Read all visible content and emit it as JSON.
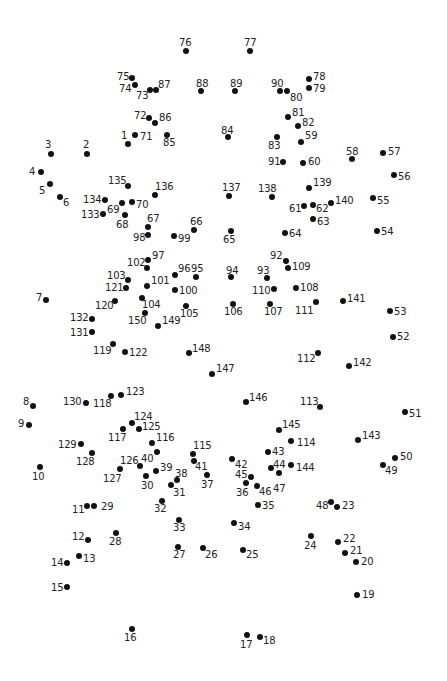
{
  "puzzle": {
    "title": "",
    "dot_color": "#111111",
    "label_color": "#222222",
    "points": [
      {
        "n": "1",
        "x": 128,
        "y": 144,
        "lx": 121,
        "ly": 131
      },
      {
        "n": "2",
        "x": 87,
        "y": 154,
        "lx": 83,
        "ly": 140
      },
      {
        "n": "3",
        "x": 51,
        "y": 154,
        "lx": 45,
        "ly": 140
      },
      {
        "n": "4",
        "x": 41,
        "y": 172,
        "lx": 29,
        "ly": 167
      },
      {
        "n": "5",
        "x": 50,
        "y": 184,
        "lx": 39,
        "ly": 186
      },
      {
        "n": "6",
        "x": 60,
        "y": 197,
        "lx": 63,
        "ly": 198
      },
      {
        "n": "7",
        "x": 46,
        "y": 300,
        "lx": 36,
        "ly": 293
      },
      {
        "n": "8",
        "x": 33,
        "y": 406,
        "lx": 23,
        "ly": 397
      },
      {
        "n": "9",
        "x": 29,
        "y": 425,
        "lx": 18,
        "ly": 419
      },
      {
        "n": "10",
        "x": 40,
        "y": 467,
        "lx": 32,
        "ly": 472
      },
      {
        "n": "11",
        "x": 87,
        "y": 506,
        "lx": 72,
        "ly": 505
      },
      {
        "n": "12",
        "x": 88,
        "y": 540,
        "lx": 72,
        "ly": 532
      },
      {
        "n": "13",
        "x": 79,
        "y": 556,
        "lx": 83,
        "ly": 554
      },
      {
        "n": "14",
        "x": 67,
        "y": 563,
        "lx": 51,
        "ly": 558
      },
      {
        "n": "15",
        "x": 67,
        "y": 587,
        "lx": 51,
        "ly": 583
      },
      {
        "n": "16",
        "x": 132,
        "y": 629,
        "lx": 124,
        "ly": 633
      },
      {
        "n": "17",
        "x": 247,
        "y": 635,
        "lx": 240,
        "ly": 640
      },
      {
        "n": "18",
        "x": 260,
        "y": 637,
        "lx": 263,
        "ly": 636
      },
      {
        "n": "19",
        "x": 357,
        "y": 595,
        "lx": 362,
        "ly": 590
      },
      {
        "n": "20",
        "x": 356,
        "y": 562,
        "lx": 361,
        "ly": 557
      },
      {
        "n": "21",
        "x": 345,
        "y": 553,
        "lx": 350,
        "ly": 546
      },
      {
        "n": "22",
        "x": 338,
        "y": 542,
        "lx": 343,
        "ly": 534
      },
      {
        "n": "23",
        "x": 337,
        "y": 507,
        "lx": 342,
        "ly": 501
      },
      {
        "n": "24",
        "x": 311,
        "y": 536,
        "lx": 304,
        "ly": 541
      },
      {
        "n": "25",
        "x": 243,
        "y": 550,
        "lx": 246,
        "ly": 550
      },
      {
        "n": "26",
        "x": 203,
        "y": 548,
        "lx": 205,
        "ly": 550
      },
      {
        "n": "27",
        "x": 178,
        "y": 547,
        "lx": 173,
        "ly": 550
      },
      {
        "n": "28",
        "x": 116,
        "y": 533,
        "lx": 109,
        "ly": 537
      },
      {
        "n": "29",
        "x": 94,
        "y": 506,
        "lx": 101,
        "ly": 502
      },
      {
        "n": "30",
        "x": 146,
        "y": 476,
        "lx": 141,
        "ly": 481
      },
      {
        "n": "31",
        "x": 171,
        "y": 485,
        "lx": 173,
        "ly": 488
      },
      {
        "n": "32",
        "x": 162,
        "y": 501,
        "lx": 154,
        "ly": 504
      },
      {
        "n": "33",
        "x": 179,
        "y": 520,
        "lx": 173,
        "ly": 523
      },
      {
        "n": "34",
        "x": 234,
        "y": 523,
        "lx": 238,
        "ly": 522
      },
      {
        "n": "35",
        "x": 258,
        "y": 505,
        "lx": 262,
        "ly": 501
      },
      {
        "n": "36",
        "x": 246,
        "y": 483,
        "lx": 236,
        "ly": 488
      },
      {
        "n": "37",
        "x": 207,
        "y": 475,
        "lx": 201,
        "ly": 480
      },
      {
        "n": "38",
        "x": 177,
        "y": 480,
        "lx": 175,
        "ly": 469
      },
      {
        "n": "39",
        "x": 156,
        "y": 471,
        "lx": 160,
        "ly": 463
      },
      {
        "n": "40",
        "x": 157,
        "y": 452,
        "lx": 141,
        "ly": 454
      },
      {
        "n": "41",
        "x": 194,
        "y": 461,
        "lx": 195,
        "ly": 462
      },
      {
        "n": "42",
        "x": 232,
        "y": 459,
        "lx": 235,
        "ly": 460
      },
      {
        "n": "43",
        "x": 268,
        "y": 452,
        "lx": 272,
        "ly": 447
      },
      {
        "n": "44",
        "x": 271,
        "y": 468,
        "lx": 273,
        "ly": 460
      },
      {
        "n": "45",
        "x": 251,
        "y": 477,
        "lx": 235,
        "ly": 470
      },
      {
        "n": "46",
        "x": 257,
        "y": 486,
        "lx": 259,
        "ly": 487
      },
      {
        "n": "47",
        "x": 279,
        "y": 473,
        "lx": 273,
        "ly": 484
      },
      {
        "n": "48",
        "x": 331,
        "y": 502,
        "lx": 316,
        "ly": 501
      },
      {
        "n": "49",
        "x": 383,
        "y": 465,
        "lx": 385,
        "ly": 466
      },
      {
        "n": "50",
        "x": 395,
        "y": 458,
        "lx": 400,
        "ly": 452
      },
      {
        "n": "51",
        "x": 405,
        "y": 412,
        "lx": 409,
        "ly": 409
      },
      {
        "n": "52",
        "x": 393,
        "y": 337,
        "lx": 397,
        "ly": 332
      },
      {
        "n": "53",
        "x": 390,
        "y": 311,
        "lx": 394,
        "ly": 307
      },
      {
        "n": "54",
        "x": 377,
        "y": 231,
        "lx": 381,
        "ly": 227
      },
      {
        "n": "55",
        "x": 373,
        "y": 198,
        "lx": 377,
        "ly": 196
      },
      {
        "n": "56",
        "x": 394,
        "y": 175,
        "lx": 398,
        "ly": 172
      },
      {
        "n": "57",
        "x": 383,
        "y": 153,
        "lx": 388,
        "ly": 147
      },
      {
        "n": "58",
        "x": 352,
        "y": 159,
        "lx": 346,
        "ly": 147
      },
      {
        "n": "59",
        "x": 301,
        "y": 142,
        "lx": 305,
        "ly": 131
      },
      {
        "n": "60",
        "x": 303,
        "y": 163,
        "lx": 308,
        "ly": 157
      },
      {
        "n": "61",
        "x": 304,
        "y": 206,
        "lx": 289,
        "ly": 204
      },
      {
        "n": "62",
        "x": 313,
        "y": 205,
        "lx": 316,
        "ly": 204
      },
      {
        "n": "63",
        "x": 313,
        "y": 219,
        "lx": 317,
        "ly": 217
      },
      {
        "n": "64",
        "x": 285,
        "y": 233,
        "lx": 289,
        "ly": 229
      },
      {
        "n": "65",
        "x": 231,
        "y": 231,
        "lx": 223,
        "ly": 235
      },
      {
        "n": "66",
        "x": 194,
        "y": 230,
        "lx": 190,
        "ly": 217
      },
      {
        "n": "67",
        "x": 148,
        "y": 227,
        "lx": 147,
        "ly": 214
      },
      {
        "n": "68",
        "x": 125,
        "y": 215,
        "lx": 116,
        "ly": 220
      },
      {
        "n": "69",
        "x": 122,
        "y": 203,
        "lx": 107,
        "ly": 205
      },
      {
        "n": "70",
        "x": 132,
        "y": 202,
        "lx": 136,
        "ly": 200
      },
      {
        "n": "71",
        "x": 135,
        "y": 135,
        "lx": 140,
        "ly": 132
      },
      {
        "n": "72",
        "x": 149,
        "y": 118,
        "lx": 134,
        "ly": 111
      },
      {
        "n": "73",
        "x": 150,
        "y": 90,
        "lx": 136,
        "ly": 91
      },
      {
        "n": "74",
        "x": 135,
        "y": 85,
        "lx": 119,
        "ly": 84
      },
      {
        "n": "75",
        "x": 132,
        "y": 78,
        "lx": 117,
        "ly": 72
      },
      {
        "n": "76",
        "x": 186,
        "y": 51,
        "lx": 179,
        "ly": 38
      },
      {
        "n": "77",
        "x": 250,
        "y": 51,
        "lx": 244,
        "ly": 38
      },
      {
        "n": "78",
        "x": 309,
        "y": 79,
        "lx": 313,
        "ly": 72
      },
      {
        "n": "79",
        "x": 309,
        "y": 88,
        "lx": 313,
        "ly": 84
      },
      {
        "n": "80",
        "x": 287,
        "y": 91,
        "lx": 290,
        "ly": 93
      },
      {
        "n": "81",
        "x": 288,
        "y": 117,
        "lx": 292,
        "ly": 108
      },
      {
        "n": "82",
        "x": 298,
        "y": 126,
        "lx": 302,
        "ly": 118
      },
      {
        "n": "83",
        "x": 277,
        "y": 137,
        "lx": 268,
        "ly": 141
      },
      {
        "n": "84",
        "x": 228,
        "y": 137,
        "lx": 221,
        "ly": 126
      },
      {
        "n": "85",
        "x": 167,
        "y": 135,
        "lx": 163,
        "ly": 138
      },
      {
        "n": "86",
        "x": 155,
        "y": 123,
        "lx": 159,
        "ly": 113
      },
      {
        "n": "87",
        "x": 156,
        "y": 90,
        "lx": 158,
        "ly": 80
      },
      {
        "n": "88",
        "x": 201,
        "y": 91,
        "lx": 196,
        "ly": 79
      },
      {
        "n": "89",
        "x": 235,
        "y": 91,
        "lx": 230,
        "ly": 79
      },
      {
        "n": "90",
        "x": 280,
        "y": 91,
        "lx": 271,
        "ly": 79
      },
      {
        "n": "91",
        "x": 283,
        "y": 162,
        "lx": 268,
        "ly": 157
      },
      {
        "n": "92",
        "x": 286,
        "y": 261,
        "lx": 270,
        "ly": 251
      },
      {
        "n": "93",
        "x": 267,
        "y": 278,
        "lx": 257,
        "ly": 266
      },
      {
        "n": "94",
        "x": 231,
        "y": 277,
        "lx": 226,
        "ly": 266
      },
      {
        "n": "95",
        "x": 196,
        "y": 277,
        "lx": 191,
        "ly": 264
      },
      {
        "n": "96",
        "x": 175,
        "y": 275,
        "lx": 178,
        "ly": 264
      },
      {
        "n": "97",
        "x": 148,
        "y": 260,
        "lx": 152,
        "ly": 251
      },
      {
        "n": "98",
        "x": 148,
        "y": 235,
        "lx": 133,
        "ly": 233
      },
      {
        "n": "99",
        "x": 174,
        "y": 236,
        "lx": 178,
        "ly": 234
      },
      {
        "n": "100",
        "x": 175,
        "y": 290,
        "lx": 179,
        "ly": 286
      },
      {
        "n": "101",
        "x": 147,
        "y": 286,
        "lx": 151,
        "ly": 276
      },
      {
        "n": "102",
        "x": 147,
        "y": 268,
        "lx": 127,
        "ly": 258
      },
      {
        "n": "103",
        "x": 128,
        "y": 280,
        "lx": 107,
        "ly": 271
      },
      {
        "n": "104",
        "x": 142,
        "y": 298,
        "lx": 142,
        "ly": 300
      },
      {
        "n": "105",
        "x": 186,
        "y": 306,
        "lx": 180,
        "ly": 309
      },
      {
        "n": "106",
        "x": 233,
        "y": 304,
        "lx": 224,
        "ly": 307
      },
      {
        "n": "107",
        "x": 270,
        "y": 304,
        "lx": 264,
        "ly": 307
      },
      {
        "n": "108",
        "x": 296,
        "y": 288,
        "lx": 300,
        "ly": 283
      },
      {
        "n": "109",
        "x": 288,
        "y": 268,
        "lx": 292,
        "ly": 262
      },
      {
        "n": "110",
        "x": 274,
        "y": 289,
        "lx": 252,
        "ly": 286
      },
      {
        "n": "111",
        "x": 316,
        "y": 302,
        "lx": 295,
        "ly": 306
      },
      {
        "n": "112",
        "x": 318,
        "y": 353,
        "lx": 297,
        "ly": 354
      },
      {
        "n": "113",
        "x": 320,
        "y": 407,
        "lx": 300,
        "ly": 397
      },
      {
        "n": "114",
        "x": 291,
        "y": 441,
        "lx": 297,
        "ly": 438
      },
      {
        "n": "115",
        "x": 193,
        "y": 454,
        "lx": 193,
        "ly": 441
      },
      {
        "n": "116",
        "x": 152,
        "y": 443,
        "lx": 156,
        "ly": 433
      },
      {
        "n": "117",
        "x": 123,
        "y": 429,
        "lx": 108,
        "ly": 433
      },
      {
        "n": "118",
        "x": 111,
        "y": 396,
        "lx": 93,
        "ly": 399
      },
      {
        "n": "119",
        "x": 113,
        "y": 344,
        "lx": 93,
        "ly": 346
      },
      {
        "n": "120",
        "x": 115,
        "y": 301,
        "lx": 95,
        "ly": 301
      },
      {
        "n": "121",
        "x": 126,
        "y": 288,
        "lx": 105,
        "ly": 283
      },
      {
        "n": "122",
        "x": 125,
        "y": 352,
        "lx": 129,
        "ly": 348
      },
      {
        "n": "123",
        "x": 121,
        "y": 395,
        "lx": 126,
        "ly": 387
      },
      {
        "n": "124",
        "x": 132,
        "y": 423,
        "lx": 134,
        "ly": 412
      },
      {
        "n": "125",
        "x": 139,
        "y": 429,
        "lx": 142,
        "ly": 422
      },
      {
        "n": "126",
        "x": 140,
        "y": 466,
        "lx": 120,
        "ly": 456
      },
      {
        "n": "127",
        "x": 120,
        "y": 469,
        "lx": 103,
        "ly": 474
      },
      {
        "n": "128",
        "x": 92,
        "y": 453,
        "lx": 76,
        "ly": 457
      },
      {
        "n": "129",
        "x": 81,
        "y": 444,
        "lx": 58,
        "ly": 440
      },
      {
        "n": "130",
        "x": 86,
        "y": 403,
        "lx": 63,
        "ly": 397
      },
      {
        "n": "131",
        "x": 92,
        "y": 332,
        "lx": 70,
        "ly": 328
      },
      {
        "n": "132",
        "x": 92,
        "y": 319,
        "lx": 70,
        "ly": 313
      },
      {
        "n": "133",
        "x": 103,
        "y": 214,
        "lx": 81,
        "ly": 210
      },
      {
        "n": "134",
        "x": 105,
        "y": 200,
        "lx": 83,
        "ly": 195
      },
      {
        "n": "135",
        "x": 128,
        "y": 186,
        "lx": 108,
        "ly": 176
      },
      {
        "n": "136",
        "x": 155,
        "y": 195,
        "lx": 155,
        "ly": 182
      },
      {
        "n": "137",
        "x": 229,
        "y": 196,
        "lx": 222,
        "ly": 183
      },
      {
        "n": "138",
        "x": 272,
        "y": 197,
        "lx": 258,
        "ly": 184
      },
      {
        "n": "139",
        "x": 309,
        "y": 188,
        "lx": 313,
        "ly": 178
      },
      {
        "n": "140",
        "x": 331,
        "y": 203,
        "lx": 335,
        "ly": 196
      },
      {
        "n": "141",
        "x": 343,
        "y": 301,
        "lx": 347,
        "ly": 294
      },
      {
        "n": "142",
        "x": 349,
        "y": 366,
        "lx": 353,
        "ly": 358
      },
      {
        "n": "143",
        "x": 358,
        "y": 440,
        "lx": 362,
        "ly": 431
      },
      {
        "n": "144",
        "x": 291,
        "y": 465,
        "lx": 296,
        "ly": 463
      },
      {
        "n": "145",
        "x": 279,
        "y": 430,
        "lx": 282,
        "ly": 420
      },
      {
        "n": "146",
        "x": 246,
        "y": 402,
        "lx": 249,
        "ly": 393
      },
      {
        "n": "147",
        "x": 212,
        "y": 374,
        "lx": 216,
        "ly": 364
      },
      {
        "n": "148",
        "x": 189,
        "y": 353,
        "lx": 192,
        "ly": 344
      },
      {
        "n": "149",
        "x": 158,
        "y": 326,
        "lx": 162,
        "ly": 316
      },
      {
        "n": "150",
        "x": 145,
        "y": 313,
        "lx": 128,
        "ly": 316
      }
    ]
  }
}
